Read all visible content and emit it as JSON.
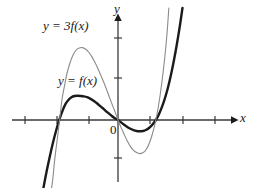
{
  "figure": {
    "background": "#ffffff",
    "width": 263,
    "height": 188
  },
  "labels": {
    "axis_y": "y",
    "axis_x": "x",
    "origin": "0",
    "curve_base": "y = f(x)",
    "curve_scaled": "y = 3f(x)"
  },
  "chart_data": {
    "type": "line",
    "title": "",
    "subtitle": "",
    "xlabel": "x",
    "ylabel": "y",
    "grid": false,
    "legend_position": "inline-annotation",
    "annotations": [
      {
        "text": "y = 3f(x)",
        "x": -1.95,
        "y": 3.1,
        "target_series": "y = 3f(x)"
      },
      {
        "text": "y = f(x)",
        "x": -1.25,
        "y": 1.25,
        "target_series": "y = f(x)"
      },
      {
        "text": "0",
        "x": -0.12,
        "y": -0.25,
        "target_series": "origin"
      }
    ],
    "axes": {
      "x_axis_pixel_y": 120,
      "y_axis_pixel_x": 118,
      "x_range_pixels": [
        12,
        238
      ],
      "y_range_pixels": [
        14,
        188
      ],
      "x_ticks_pixels": [
        25,
        57,
        89,
        150,
        183,
        215
      ],
      "y_ticks_pixels": [
        38,
        78,
        158
      ],
      "unit_px_x": 31,
      "unit_px_y": 20,
      "xlim": [
        -3.4,
        3.9
      ],
      "ylim": [
        -4.2,
        5.3
      ],
      "x_tick_values": [
        -3,
        -2,
        -1,
        1,
        2,
        3
      ],
      "y_tick_values": [
        4,
        2,
        -2
      ],
      "arrow_ends": [
        "x-positive",
        "y-positive"
      ]
    },
    "series": [
      {
        "name": "y = f(x)",
        "color": "#1b1b1b",
        "width": 2.4,
        "roots_x": [
          -2,
          0,
          1.35
        ],
        "local_max": {
          "x": -1.15,
          "y": 1.2
        },
        "local_min": {
          "x": 0.8,
          "y": -0.55
        },
        "points": [
          [
            -2.48,
            -4.05
          ],
          [
            -2.4,
            -3.35
          ],
          [
            -2.3,
            -2.55
          ],
          [
            -2.2,
            -1.82
          ],
          [
            -2.1,
            -1.15
          ],
          [
            -2.0,
            -0.55
          ],
          [
            -1.9,
            -0.02
          ],
          [
            -1.8,
            0.42
          ],
          [
            -1.7,
            0.78
          ],
          [
            -1.6,
            1.0
          ],
          [
            -1.5,
            1.14
          ],
          [
            -1.4,
            1.2
          ],
          [
            -1.3,
            1.21
          ],
          [
            -1.2,
            1.2
          ],
          [
            -1.1,
            1.18
          ],
          [
            -1.0,
            1.14
          ],
          [
            -0.9,
            1.07
          ],
          [
            -0.8,
            0.98
          ],
          [
            -0.7,
            0.86
          ],
          [
            -0.6,
            0.73
          ],
          [
            -0.5,
            0.6
          ],
          [
            -0.4,
            0.46
          ],
          [
            -0.3,
            0.33
          ],
          [
            -0.2,
            0.2
          ],
          [
            -0.1,
            0.09
          ],
          [
            0.0,
            0.0
          ],
          [
            0.1,
            -0.12
          ],
          [
            0.2,
            -0.24
          ],
          [
            0.3,
            -0.35
          ],
          [
            0.4,
            -0.44
          ],
          [
            0.5,
            -0.51
          ],
          [
            0.6,
            -0.55
          ],
          [
            0.7,
            -0.56
          ],
          [
            0.8,
            -0.55
          ],
          [
            0.9,
            -0.5
          ],
          [
            1.0,
            -0.4
          ],
          [
            1.1,
            -0.25
          ],
          [
            1.2,
            -0.05
          ],
          [
            1.3,
            0.22
          ],
          [
            1.4,
            0.58
          ],
          [
            1.5,
            1.02
          ],
          [
            1.6,
            1.55
          ],
          [
            1.7,
            2.2
          ],
          [
            1.8,
            2.95
          ],
          [
            1.9,
            3.8
          ],
          [
            2.0,
            4.75
          ],
          [
            2.08,
            5.6
          ]
        ]
      },
      {
        "name": "y = 3f(x)",
        "color": "#8a8a8a",
        "width": 1.1,
        "roots_x": [
          -2,
          0,
          1.35
        ],
        "local_max": {
          "x": -1.15,
          "y": 3.6
        },
        "local_min": {
          "x": 0.8,
          "y": -1.65
        },
        "points": [
          [
            -2.18,
            -4.05
          ],
          [
            -2.15,
            -3.5
          ],
          [
            -2.1,
            -2.9
          ],
          [
            -2.05,
            -2.1
          ],
          [
            -2.0,
            -1.45
          ],
          [
            -1.95,
            -0.85
          ],
          [
            -1.9,
            -0.2
          ],
          [
            -1.85,
            0.45
          ],
          [
            -1.8,
            1.1
          ],
          [
            -1.72,
            1.75
          ],
          [
            -1.65,
            2.3
          ],
          [
            -1.55,
            2.85
          ],
          [
            -1.45,
            3.25
          ],
          [
            -1.35,
            3.5
          ],
          [
            -1.25,
            3.6
          ],
          [
            -1.15,
            3.62
          ],
          [
            -1.05,
            3.55
          ],
          [
            -0.95,
            3.4
          ],
          [
            -0.85,
            3.18
          ],
          [
            -0.75,
            2.9
          ],
          [
            -0.65,
            2.58
          ],
          [
            -0.55,
            2.22
          ],
          [
            -0.45,
            1.85
          ],
          [
            -0.35,
            1.45
          ],
          [
            -0.25,
            1.03
          ],
          [
            -0.15,
            0.62
          ],
          [
            -0.05,
            0.22
          ],
          [
            0.0,
            0.0
          ],
          [
            0.1,
            -0.38
          ],
          [
            0.2,
            -0.72
          ],
          [
            0.3,
            -1.05
          ],
          [
            0.4,
            -1.32
          ],
          [
            0.5,
            -1.52
          ],
          [
            0.6,
            -1.63
          ],
          [
            0.7,
            -1.68
          ],
          [
            0.8,
            -1.64
          ],
          [
            0.9,
            -1.5
          ],
          [
            1.0,
            -1.2
          ],
          [
            1.1,
            -0.75
          ],
          [
            1.2,
            -0.15
          ],
          [
            1.3,
            0.65
          ],
          [
            1.4,
            1.7
          ],
          [
            1.5,
            3.0
          ],
          [
            1.58,
            4.3
          ],
          [
            1.64,
            5.6
          ]
        ]
      }
    ]
  }
}
